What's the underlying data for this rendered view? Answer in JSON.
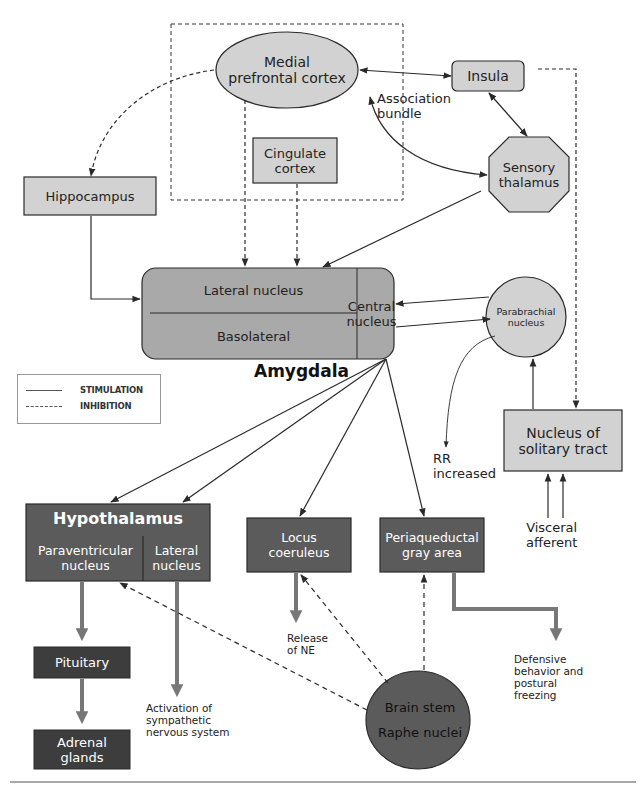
{
  "diagram": {
    "caption_visible": "FIGURE 20-3 Fear/amygdala circuitry (partially visible)",
    "colors": {
      "light_fill": "#d2d2d2",
      "mid_fill": "#a9a9a9",
      "dark_fill": "#5b5b5b",
      "darkest_fill": "#3d3d3d",
      "thick_arrow": "#777777",
      "stroke": "#2a2a2a"
    },
    "nodes": {
      "medial_prefrontal_cortex": {
        "line1": "Medial",
        "line2": "prefrontal cortex",
        "shape": "ellipse"
      },
      "insula": {
        "label": "Insula",
        "shape": "rounded-rect"
      },
      "cingulate_cortex": {
        "line1": "Cingulate",
        "line2": "cortex",
        "shape": "rect"
      },
      "sensory_thalamus": {
        "line1": "Sensory",
        "line2": "thalamus",
        "shape": "octagon"
      },
      "hippocampus": {
        "label": "Hippocampus",
        "shape": "rect"
      },
      "amygdala": {
        "title": "Amygdala",
        "lateral_nucleus": "Lateral nucleus",
        "basolateral": "Basolateral",
        "central_line1": "Central",
        "central_line2": "nucleus"
      },
      "parabrachial_nucleus": {
        "line1": "Parabrachial",
        "line2": "nucleus",
        "shape": "circle"
      },
      "nucleus_solitary_tract": {
        "line1": "Nucleus of",
        "line2": "solitary tract",
        "shape": "rect"
      },
      "hypothalamus": {
        "title": "Hypothalamus",
        "paraventricular_line1": "Paraventricular",
        "paraventricular_line2": "nucleus",
        "lateral_line1": "Lateral",
        "lateral_line2": "nucleus"
      },
      "locus_coeruleus": {
        "line1": "Locus",
        "line2": "coeruleus"
      },
      "periaqueductal_gray": {
        "line1": "Periaqueductal",
        "line2": "gray area"
      },
      "pituitary": {
        "label": "Pituitary"
      },
      "adrenal_glands": {
        "line1": "Adrenal",
        "line2": "glands"
      },
      "brain_stem": {
        "line1": "Brain stem",
        "line2": "Raphe nuclei"
      }
    },
    "annotations": {
      "association_bundle_1": "Association",
      "association_bundle_2": "bundle",
      "rr_increased_1": "RR",
      "rr_increased_2": "increased",
      "visceral_afferent_1": "Visceral",
      "visceral_afferent_2": "afferent",
      "release_ne_1": "Release",
      "release_ne_2": "of NE",
      "activation_1": "Activation of",
      "activation_2": "sympathetic",
      "activation_3": "nervous system",
      "defensive_1": "Defensive",
      "defensive_2": "behavior and",
      "defensive_3": "postural",
      "defensive_4": "freezing"
    },
    "legend": {
      "stimulation": "STIMULATION",
      "inhibition": "INHIBITION"
    },
    "edges": [
      {
        "from": "Medial prefrontal cortex",
        "to": "Hippocampus",
        "type": "inhibition"
      },
      {
        "from": "Medial prefrontal cortex",
        "to": "Insula",
        "type": "stimulation",
        "bidirectional": true
      },
      {
        "from": "Medial prefrontal cortex",
        "to": "Sensory thalamus",
        "type": "stimulation",
        "bidirectional": true,
        "label": "Association bundle"
      },
      {
        "from": "Insula",
        "to": "Sensory thalamus",
        "type": "stimulation",
        "bidirectional": true
      },
      {
        "from": "Insula",
        "to": "Nucleus of solitary tract",
        "type": "inhibition"
      },
      {
        "from": "Medial prefrontal cortex",
        "to": "Amygdala lateral nucleus",
        "type": "inhibition"
      },
      {
        "from": "Cingulate cortex",
        "to": "Amygdala lateral nucleus",
        "type": "inhibition"
      },
      {
        "from": "Sensory thalamus",
        "to": "Amygdala lateral nucleus",
        "type": "stimulation"
      },
      {
        "from": "Hippocampus",
        "to": "Amygdala",
        "type": "stimulation"
      },
      {
        "from": "Parabrachial nucleus",
        "to": "Central nucleus",
        "type": "stimulation"
      },
      {
        "from": "Central nucleus",
        "to": "Parabrachial nucleus",
        "type": "stimulation"
      },
      {
        "from": "Parabrachial nucleus",
        "to": "RR increased",
        "type": "stimulation"
      },
      {
        "from": "Nucleus of solitary tract",
        "to": "Parabrachial nucleus",
        "type": "stimulation"
      },
      {
        "from": "Visceral afferent",
        "to": "Nucleus of solitary tract",
        "type": "stimulation"
      },
      {
        "from": "Central nucleus",
        "to": "Paraventricular nucleus",
        "type": "stimulation"
      },
      {
        "from": "Central nucleus",
        "to": "Lateral nucleus (hypothalamus)",
        "type": "stimulation"
      },
      {
        "from": "Central nucleus",
        "to": "Locus coeruleus",
        "type": "stimulation"
      },
      {
        "from": "Central nucleus",
        "to": "Periaqueductal gray area",
        "type": "stimulation"
      },
      {
        "from": "Paraventricular nucleus",
        "to": "Pituitary",
        "type": "output"
      },
      {
        "from": "Pituitary",
        "to": "Adrenal glands",
        "type": "output"
      },
      {
        "from": "Lateral nucleus (hypothalamus)",
        "to": "Activation of sympathetic nervous system",
        "type": "output"
      },
      {
        "from": "Locus coeruleus",
        "to": "Release of NE",
        "type": "output"
      },
      {
        "from": "Periaqueductal gray area",
        "to": "Defensive behavior and postural freezing",
        "type": "output"
      },
      {
        "from": "Brain stem Raphe nuclei",
        "to": "Paraventricular nucleus",
        "type": "inhibition"
      },
      {
        "from": "Brain stem Raphe nuclei",
        "to": "Locus coeruleus",
        "type": "inhibition"
      },
      {
        "from": "Brain stem Raphe nuclei",
        "to": "Periaqueductal gray area",
        "type": "inhibition"
      }
    ]
  }
}
